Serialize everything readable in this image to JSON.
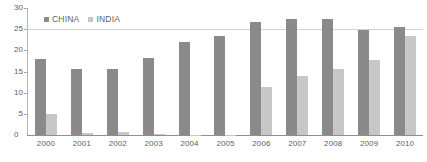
{
  "chart_data": {
    "type": "bar",
    "title": "",
    "subtitle": "",
    "xlabel": "",
    "ylabel": "",
    "categories": [
      "2000",
      "2001",
      "2002",
      "2003",
      "2004",
      "2005",
      "2006",
      "2007",
      "2008",
      "2009",
      "2010"
    ],
    "series": [
      {
        "name": "CHINA",
        "color": "#8a8a8a",
        "values": [
          18.0,
          15.5,
          15.5,
          18.2,
          22.0,
          23.3,
          26.8,
          27.5,
          27.3,
          24.7,
          25.5
        ]
      },
      {
        "name": "INDIA",
        "color": "#c7c7c7",
        "values": [
          5.0,
          0.4,
          0.6,
          0.2,
          0.1,
          0.1,
          11.3,
          14.0,
          15.5,
          17.7,
          23.3
        ]
      }
    ],
    "ylim": [
      0,
      30
    ],
    "yticks": [
      0,
      5,
      10,
      15,
      20,
      25,
      30
    ],
    "ytick_labels": [
      "0",
      "5",
      "10",
      "15",
      "20",
      "25",
      "30"
    ],
    "gridlines_at": [
      25
    ],
    "grid": "single-horizontal-at-25",
    "legend_position": "top-left-inside",
    "legend": [
      {
        "label": "CHINA",
        "swatch_color": "#8a8a8a",
        "marker": "square-marker"
      },
      {
        "label": "INDIA",
        "swatch_color": "#c7c7c7",
        "marker": "square-marker"
      }
    ],
    "annotations": []
  },
  "axis": {
    "y_axis_color": "#b4b4b4",
    "x_axis_color": "#8f8f8f",
    "tick_color": "#a9a9a9",
    "label_color": "#5e5e5e",
    "gridline_color": "#d2d2d2"
  }
}
